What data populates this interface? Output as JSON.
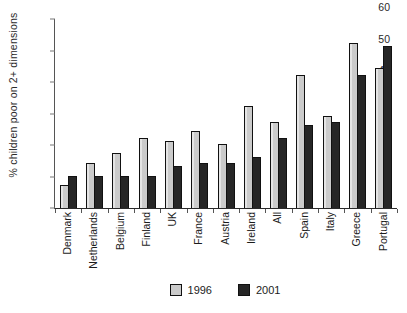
{
  "chart_data": {
    "type": "bar",
    "title": "",
    "xlabel": "",
    "ylabel": "% children poor on 2+ dimensions",
    "ylim": [
      0,
      60
    ],
    "yticks": [
      0,
      10,
      20,
      30,
      40,
      50,
      60
    ],
    "grid": false,
    "legend_position": "bottom-center",
    "categories": [
      "Denmark",
      "Netherlands",
      "Belgium",
      "Finland",
      "UK",
      "France",
      "Austria",
      "Ireland",
      "All",
      "Spain",
      "Italy",
      "Greece",
      "Portugal"
    ],
    "series": [
      {
        "name": "1996",
        "color": "#cbcbcb",
        "values": [
          7,
          14,
          17,
          22,
          21,
          24,
          20,
          32,
          27,
          42,
          29,
          52,
          44
        ]
      },
      {
        "name": "2001",
        "color": "#262626",
        "values": [
          10,
          10,
          10,
          10,
          13,
          14,
          14,
          16,
          22,
          26,
          27,
          42,
          51
        ]
      }
    ]
  },
  "legend": {
    "items": [
      {
        "label": "1996",
        "color": "#cbcbcb"
      },
      {
        "label": "2001",
        "color": "#262626"
      }
    ]
  }
}
